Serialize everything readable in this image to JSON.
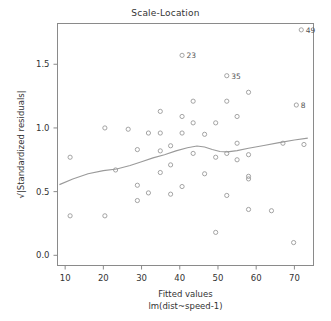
{
  "chart_data": {
    "type": "scatter",
    "title": "Scale-Location",
    "xlabel": "Fitted values",
    "xlabel2": "lm(dist~speed-1)",
    "ylabel": "√|Standardized residuals|",
    "xlim": [
      8,
      75
    ],
    "ylim": [
      -0.08,
      1.82
    ],
    "grid": false,
    "legend": "none",
    "xticks": [
      10,
      20,
      30,
      40,
      50,
      60,
      70
    ],
    "yticks": [
      0.0,
      0.5,
      1.0,
      1.5
    ],
    "ytick_labels": [
      "0.0",
      "0.5",
      "1.0",
      "1.5"
    ],
    "xtick_labels": [
      "10",
      "20",
      "30",
      "40",
      "50",
      "60",
      "70"
    ],
    "point_color": "#9a9a9a",
    "line_color": "#9a9a9a",
    "axis_color": "#8a8a8a",
    "points": [
      {
        "x": 11.3,
        "y": 0.77
      },
      {
        "x": 11.3,
        "y": 0.31
      },
      {
        "x": 20.4,
        "y": 1.0
      },
      {
        "x": 20.4,
        "y": 0.31
      },
      {
        "x": 23.2,
        "y": 0.67
      },
      {
        "x": 26.5,
        "y": 0.99
      },
      {
        "x": 28.9,
        "y": 0.83
      },
      {
        "x": 28.9,
        "y": 0.55
      },
      {
        "x": 28.9,
        "y": 0.43
      },
      {
        "x": 31.8,
        "y": 0.96
      },
      {
        "x": 31.8,
        "y": 0.49
      },
      {
        "x": 34.9,
        "y": 1.13
      },
      {
        "x": 34.9,
        "y": 0.96
      },
      {
        "x": 34.9,
        "y": 0.82
      },
      {
        "x": 34.9,
        "y": 0.65
      },
      {
        "x": 37.6,
        "y": 0.86
      },
      {
        "x": 37.6,
        "y": 0.71
      },
      {
        "x": 37.6,
        "y": 0.48
      },
      {
        "x": 40.6,
        "y": 1.57,
        "label": "23"
      },
      {
        "x": 40.6,
        "y": 1.09
      },
      {
        "x": 40.6,
        "y": 0.96
      },
      {
        "x": 40.6,
        "y": 0.54
      },
      {
        "x": 43.5,
        "y": 1.21
      },
      {
        "x": 43.5,
        "y": 1.04
      },
      {
        "x": 43.5,
        "y": 0.8
      },
      {
        "x": 46.5,
        "y": 0.95
      },
      {
        "x": 46.5,
        "y": 0.64
      },
      {
        "x": 49.4,
        "y": 1.04
      },
      {
        "x": 49.4,
        "y": 0.77
      },
      {
        "x": 49.4,
        "y": 0.18
      },
      {
        "x": 52.3,
        "y": 1.41,
        "label": "35"
      },
      {
        "x": 52.3,
        "y": 1.21
      },
      {
        "x": 52.3,
        "y": 0.8
      },
      {
        "x": 52.3,
        "y": 0.47
      },
      {
        "x": 55.0,
        "y": 1.09
      },
      {
        "x": 55.0,
        "y": 0.88
      },
      {
        "x": 55.0,
        "y": 0.75
      },
      {
        "x": 58.0,
        "y": 1.28
      },
      {
        "x": 58.0,
        "y": 0.79
      },
      {
        "x": 58.0,
        "y": 0.62
      },
      {
        "x": 58.0,
        "y": 0.6
      },
      {
        "x": 58.0,
        "y": 0.36
      },
      {
        "x": 64.0,
        "y": 0.35
      },
      {
        "x": 67.0,
        "y": 0.88
      },
      {
        "x": 69.8,
        "y": 0.1
      },
      {
        "x": 72.5,
        "y": 0.87
      },
      {
        "x": 71.8,
        "y": 1.77,
        "label": "49"
      },
      {
        "x": 70.5,
        "y": 1.18,
        "label": "8"
      }
    ],
    "loess": [
      {
        "x": 8.5,
        "y": 0.555
      },
      {
        "x": 12,
        "y": 0.6
      },
      {
        "x": 16,
        "y": 0.64
      },
      {
        "x": 20,
        "y": 0.665
      },
      {
        "x": 23.5,
        "y": 0.678
      },
      {
        "x": 27,
        "y": 0.705
      },
      {
        "x": 30,
        "y": 0.735
      },
      {
        "x": 33,
        "y": 0.765
      },
      {
        "x": 36,
        "y": 0.79
      },
      {
        "x": 39,
        "y": 0.82
      },
      {
        "x": 42,
        "y": 0.845
      },
      {
        "x": 44.5,
        "y": 0.858
      },
      {
        "x": 46.5,
        "y": 0.85
      },
      {
        "x": 48.5,
        "y": 0.83
      },
      {
        "x": 50.5,
        "y": 0.815
      },
      {
        "x": 52.5,
        "y": 0.812
      },
      {
        "x": 55,
        "y": 0.822
      },
      {
        "x": 58,
        "y": 0.84
      },
      {
        "x": 62,
        "y": 0.862
      },
      {
        "x": 66,
        "y": 0.885
      },
      {
        "x": 70,
        "y": 0.905
      },
      {
        "x": 73.5,
        "y": 0.92
      }
    ]
  }
}
